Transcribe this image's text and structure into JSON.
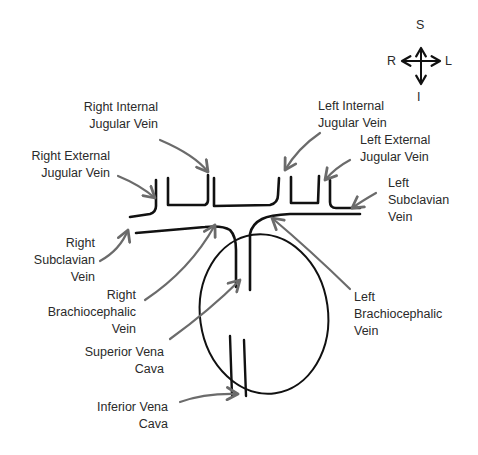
{
  "diagram": {
    "compass": {
      "superior": "S",
      "inferior": "I",
      "right": "R",
      "left": "L"
    },
    "labels": {
      "right_internal_jugular": {
        "line1": "Right Internal",
        "line2": "Jugular Vein"
      },
      "right_external_jugular": {
        "line1": "Right External",
        "line2": "Jugular Vein"
      },
      "left_internal_jugular": {
        "line1": "Left Internal",
        "line2": "Jugular Vein"
      },
      "left_external_jugular": {
        "line1": "Left External",
        "line2": "Jugular Vein"
      },
      "left_subclavian": {
        "line1": "Left",
        "line2": "Subclavian",
        "line3": "Vein"
      },
      "right_subclavian": {
        "line1": "Right",
        "line2": "Subclavian",
        "line3": "Vein"
      },
      "right_brachiocephalic": {
        "line1": "Right",
        "line2": "Brachiocephalic",
        "line3": "Vein"
      },
      "left_brachiocephalic": {
        "line1": "Left",
        "line2": "Brachiocephalic",
        "line3": "Vein"
      },
      "superior_vena_cava": {
        "line1": "Superior Vena",
        "line2": "Cava"
      },
      "inferior_vena_cava": {
        "line1": "Inferior Vena",
        "line2": "Cava"
      }
    },
    "colors": {
      "vein_stroke": "#111111",
      "arrow_stroke": "#6b6b6b",
      "text": "#2a2a2a",
      "background": "#ffffff"
    }
  }
}
